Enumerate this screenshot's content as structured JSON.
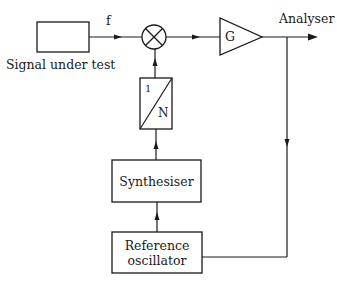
{
  "diagram": {
    "type": "block-diagram",
    "blocks": {
      "signal_source": {
        "label": "Signal under test"
      },
      "signal_line": {
        "label": "f"
      },
      "mixer": {
        "symbol": "multiplier-circle"
      },
      "amplifier": {
        "label": "G"
      },
      "output": {
        "label": "Analyser"
      },
      "divider": {
        "numerator": "1",
        "denominator": "N"
      },
      "synthesiser": {
        "label": "Synthesiser"
      },
      "reference": {
        "label_line1": "Reference",
        "label_line2": "oscillator"
      }
    },
    "connections": [
      {
        "from": "Signal under test",
        "to": "mixer",
        "label": "f"
      },
      {
        "from": "mixer",
        "to": "G"
      },
      {
        "from": "G",
        "to": "Analyser"
      },
      {
        "from": "G output",
        "to": "Reference oscillator"
      },
      {
        "from": "Reference oscillator",
        "to": "Synthesiser"
      },
      {
        "from": "Synthesiser",
        "to": "1/N divider"
      },
      {
        "from": "1/N divider",
        "to": "mixer"
      }
    ],
    "colors": {
      "ink": "#1a1a1a",
      "background": "#ffffff"
    }
  }
}
